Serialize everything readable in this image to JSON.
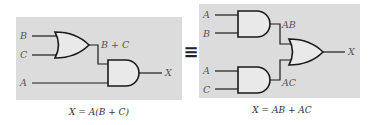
{
  "left_circuit": {
    "inputs": {
      "b": "B",
      "c": "C",
      "a": "A"
    },
    "intermediate_label": "B + C",
    "output": "X",
    "caption": "X = A(B + C)",
    "gates": [
      "OR",
      "AND"
    ]
  },
  "equivalence_symbol": "≡",
  "right_circuit": {
    "inputs": {
      "a1": "A",
      "b": "B",
      "a2": "A",
      "c": "C"
    },
    "intermediate_labels": {
      "top": "AB",
      "bottom": "AC"
    },
    "output": "X",
    "caption": "X = AB + AC",
    "gates": [
      "AND",
      "AND",
      "OR"
    ]
  },
  "colors": {
    "panel": "#dcdcdc",
    "gate_fill": "#e9e9e9",
    "line": "#1a1a1a"
  }
}
